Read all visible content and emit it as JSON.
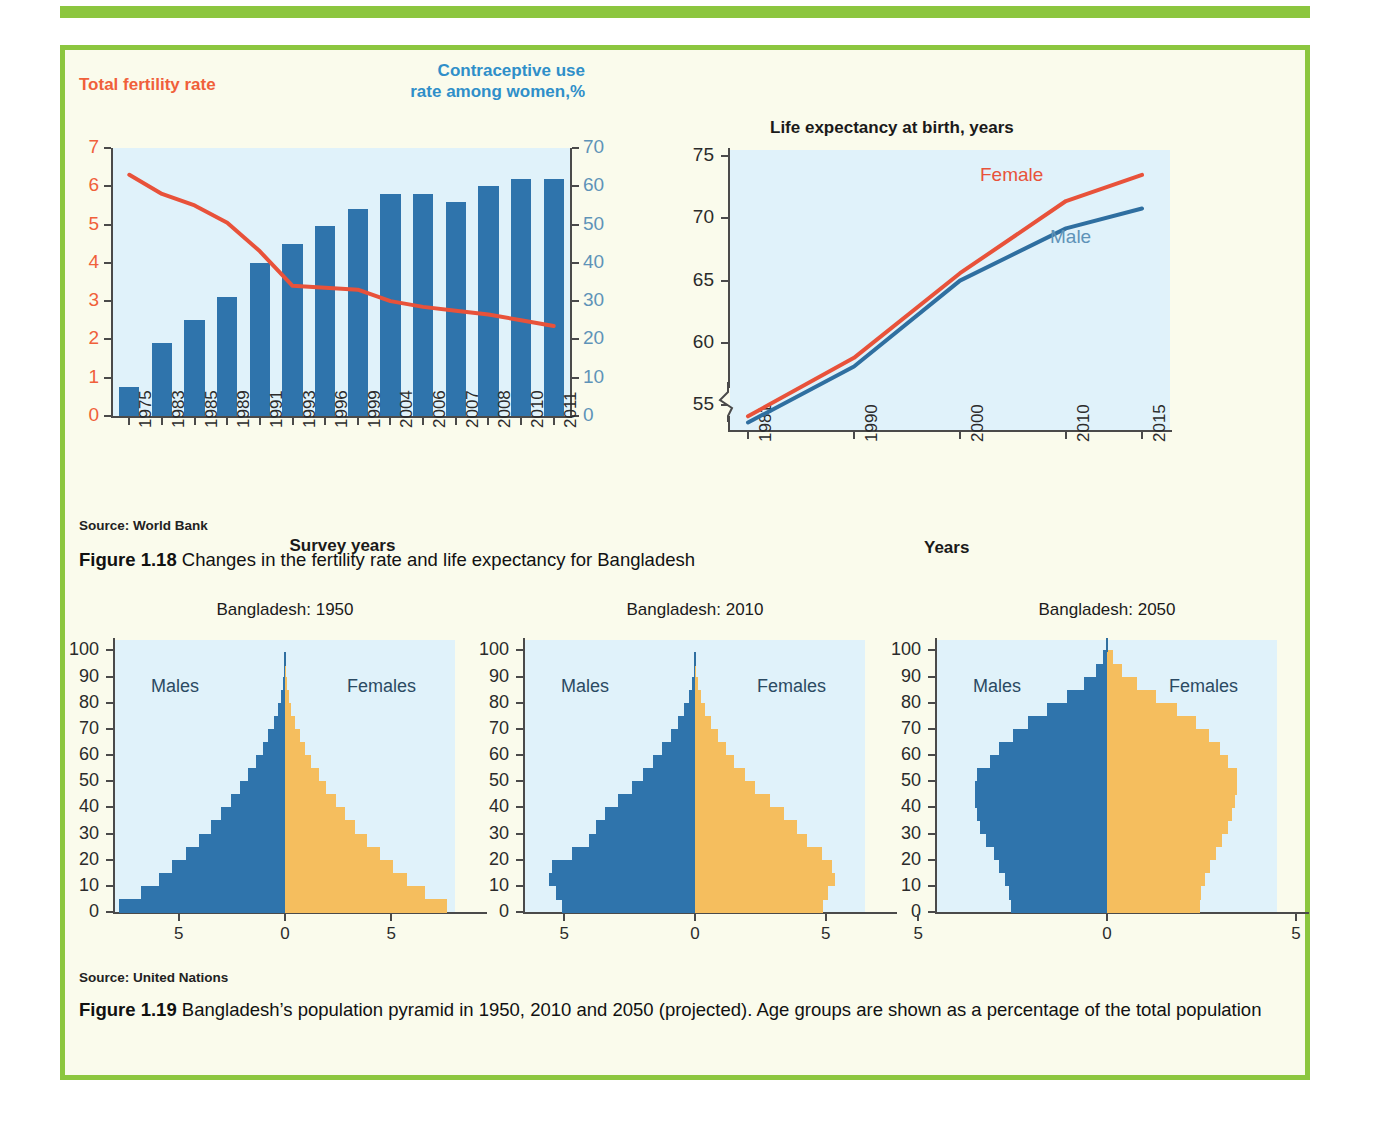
{
  "colors": {
    "frame_green": "#8CC63F",
    "page_bg": "#FAFBEC",
    "plot_bg": "#E0F2FA",
    "bar_blue": "#2F74AC",
    "female_orange": "#F5BE5E",
    "line_red": "#E8523A",
    "line_blue": "#2F6FA0",
    "left_axis_label": "#F0603A",
    "right_axis_label": "#5E93B8",
    "contraceptive_heading": "#2F8FC9"
  },
  "fig118": {
    "left_axis_heading": "Total fertility rate",
    "right_axis_heading": "Contraceptive use rate among women,%",
    "source": "Source: World Bank",
    "caption_number": "Figure 1.18",
    "caption_text": " Changes in the fertility rate and life expectancy for Bangladesh"
  },
  "fig119": {
    "source": "Source: United Nations",
    "caption_number": "Figure 1.19",
    "caption_text": " Bangladesh’s population pyramid in 1950, 2010 and 2050 (projected). Age groups are shown as a percentage of the total population"
  },
  "chart_data": [
    {
      "type": "bar",
      "id": "fertility-contraceptive",
      "title": "",
      "xlabel": "Survey years",
      "ylabel": "Total fertility rate",
      "y2label": "Contraceptive use rate among women,%",
      "grid": false,
      "legend": "none",
      "categories": [
        "1975",
        "1983",
        "1985",
        "1989",
        "1991",
        "1993",
        "1996",
        "1999",
        "2004",
        "2006",
        "2007",
        "2008",
        "2010",
        "2011"
      ],
      "ylim": [
        0,
        7
      ],
      "yticks": [
        "0",
        "1",
        "2",
        "3",
        "4",
        "5",
        "6",
        "7"
      ],
      "y2lim": [
        0,
        70
      ],
      "y2ticks": [
        "0",
        "10",
        "20",
        "30",
        "40",
        "50",
        "60",
        "70"
      ],
      "series": [
        {
          "name": "Contraceptive use rate among women, %",
          "axis": "right",
          "kind": "bar",
          "color": "#2F74AC",
          "values": [
            7.5,
            19,
            25,
            31,
            40,
            45,
            49.5,
            54,
            58,
            58,
            56,
            60,
            62,
            62
          ]
        },
        {
          "name": "Total fertility rate",
          "axis": "left",
          "kind": "line",
          "color": "#E8523A",
          "values": [
            6.3,
            5.8,
            5.5,
            5.05,
            4.3,
            3.4,
            3.35,
            3.3,
            3.0,
            2.85,
            2.75,
            2.65,
            2.5,
            2.35
          ]
        }
      ]
    },
    {
      "type": "line",
      "id": "life-expectancy",
      "title": "Life expectancy at birth, years",
      "xlabel": "Years",
      "ylabel": "",
      "grid": false,
      "axis_break_below": 55,
      "x": [
        "1981",
        "1990",
        "2000",
        "2010",
        "2015"
      ],
      "ylim": [
        53,
        75
      ],
      "yticks": [
        "55",
        "60",
        "65",
        "70",
        "75"
      ],
      "series": [
        {
          "name": "Female",
          "color": "#E8523A",
          "values": [
            54.1,
            58.8,
            65.6,
            71.4,
            73.5
          ]
        },
        {
          "name": "Male",
          "color": "#2F6FA0",
          "values": [
            53.6,
            58.1,
            65.0,
            69.2,
            70.8
          ]
        }
      ]
    },
    {
      "type": "bar",
      "id": "pyramid-1950",
      "orientation": "population-pyramid",
      "title": "Bangladesh: 1950",
      "xlabel": "",
      "ylabel": "",
      "left_label": "Males",
      "right_label": "Females",
      "yticks": [
        "0",
        "10",
        "20",
        "30",
        "40",
        "50",
        "60",
        "70",
        "80",
        "90",
        "100"
      ],
      "ylim": [
        0,
        104
      ],
      "xticks": [
        "5",
        "0",
        "5"
      ],
      "xlim": [
        8,
        8
      ],
      "age_groups": [
        "0-4",
        "5-9",
        "10-14",
        "15-19",
        "20-24",
        "25-29",
        "30-34",
        "35-39",
        "40-44",
        "45-49",
        "50-54",
        "55-59",
        "60-64",
        "65-69",
        "70-74",
        "75-79",
        "80-84",
        "85-89",
        "90+"
      ],
      "males": [
        7.8,
        6.8,
        5.95,
        5.3,
        4.65,
        4.05,
        3.5,
        3.0,
        2.55,
        2.1,
        1.72,
        1.36,
        1.05,
        0.78,
        0.54,
        0.35,
        0.2,
        0.1,
        0.04
      ],
      "females": [
        7.6,
        6.6,
        5.75,
        5.1,
        4.45,
        3.85,
        3.3,
        2.82,
        2.38,
        1.95,
        1.58,
        1.24,
        0.95,
        0.7,
        0.48,
        0.3,
        0.17,
        0.08,
        0.03
      ]
    },
    {
      "type": "bar",
      "id": "pyramid-2010",
      "orientation": "population-pyramid",
      "title": "Bangladesh: 2010",
      "xlabel": "",
      "ylabel": "",
      "left_label": "Males",
      "right_label": "Females",
      "yticks": [
        "0",
        "10",
        "20",
        "30",
        "40",
        "50",
        "60",
        "70",
        "80",
        "90",
        "100"
      ],
      "ylim": [
        0,
        104
      ],
      "xticks": [
        "5",
        "0",
        "5"
      ],
      "xlim": [
        6.5,
        6.5
      ],
      "age_groups": [
        "0-4",
        "5-9",
        "10-14",
        "15-19",
        "20-24",
        "25-29",
        "30-34",
        "35-39",
        "40-44",
        "45-49",
        "50-54",
        "55-59",
        "60-64",
        "65-69",
        "70-74",
        "75-79",
        "80-84",
        "85-89",
        "90+"
      ],
      "males": [
        5.1,
        5.3,
        5.6,
        5.45,
        4.7,
        4.05,
        3.8,
        3.45,
        2.95,
        2.4,
        2.0,
        1.6,
        1.25,
        0.92,
        0.66,
        0.42,
        0.24,
        0.11,
        0.04
      ],
      "females": [
        4.9,
        5.1,
        5.35,
        5.25,
        4.85,
        4.3,
        3.9,
        3.4,
        2.85,
        2.3,
        1.9,
        1.5,
        1.18,
        0.88,
        0.62,
        0.4,
        0.22,
        0.1,
        0.04
      ]
    },
    {
      "type": "bar",
      "id": "pyramid-2050",
      "orientation": "population-pyramid",
      "title": "Bangladesh: 2050",
      "xlabel": "",
      "ylabel": "",
      "left_label": "Males",
      "right_label": "Females",
      "yticks": [
        "0",
        "10",
        "20",
        "30",
        "40",
        "50",
        "60",
        "70",
        "80",
        "90",
        "100"
      ],
      "ylim": [
        0,
        104
      ],
      "xticks": [
        "5",
        "0",
        "5"
      ],
      "xlim": [
        4.5,
        4.5
      ],
      "age_groups": [
        "0-4",
        "5-9",
        "10-14",
        "15-19",
        "20-24",
        "25-29",
        "30-34",
        "35-39",
        "40-44",
        "45-49",
        "50-54",
        "55-59",
        "60-64",
        "65-69",
        "70-74",
        "75-79",
        "80-84",
        "85-89",
        "90+",
        "95+"
      ],
      "males": [
        2.55,
        2.6,
        2.7,
        2.85,
        3.0,
        3.2,
        3.35,
        3.45,
        3.5,
        3.5,
        3.45,
        3.1,
        2.85,
        2.5,
        2.1,
        1.6,
        1.05,
        0.6,
        0.28,
        0.1
      ],
      "females": [
        2.45,
        2.5,
        2.6,
        2.72,
        2.88,
        3.05,
        3.2,
        3.3,
        3.4,
        3.45,
        3.45,
        3.2,
        3.0,
        2.7,
        2.35,
        1.85,
        1.3,
        0.8,
        0.4,
        0.15
      ]
    }
  ]
}
